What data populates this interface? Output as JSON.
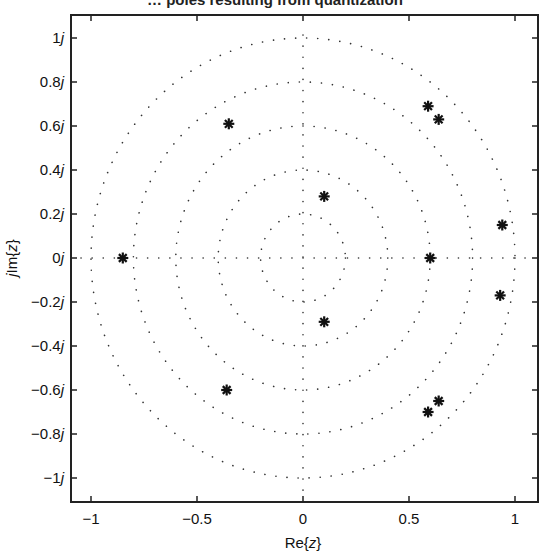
{
  "chart_data": {
    "type": "scatter",
    "title": "… poles resulting from quantization",
    "xlabel": "Re{z}",
    "ylabel": "jIm{z}",
    "xlim": [
      -1.1,
      1.1
    ],
    "ylim": [
      -1.1,
      1.1
    ],
    "x_ticks": [
      -1,
      -0.5,
      0,
      0.5,
      1
    ],
    "x_tick_labels": [
      "−1",
      "−0.5",
      "0",
      "0.5",
      "1"
    ],
    "y_ticks": [
      1,
      0.8,
      0.6,
      0.4,
      0.2,
      0,
      -0.2,
      -0.4,
      -0.6,
      -0.8,
      -1
    ],
    "y_tick_labels": [
      "1j",
      "0.8j",
      "0.6j",
      "0.4j",
      "0.2j",
      "0j",
      "−0.2j",
      "−0.4j",
      "−0.6j",
      "−0.8j",
      "−1j"
    ],
    "grid": "polar dotted (circles r=0.2,0.4,0.6,0.8,1.0 and real/imag axes)",
    "grid_circle_radii": [
      0.2,
      0.4,
      0.6,
      0.8,
      1.0
    ],
    "marker": "asterisk",
    "series": [
      {
        "name": "poles",
        "points": [
          {
            "x": -0.85,
            "y": 0.0
          },
          {
            "x": -0.35,
            "y": 0.61
          },
          {
            "x": -0.36,
            "y": -0.6
          },
          {
            "x": 0.1,
            "y": 0.28
          },
          {
            "x": 0.1,
            "y": -0.29
          },
          {
            "x": 0.59,
            "y": 0.69
          },
          {
            "x": 0.64,
            "y": 0.63
          },
          {
            "x": 0.6,
            "y": 0.0
          },
          {
            "x": 0.94,
            "y": 0.15
          },
          {
            "x": 0.93,
            "y": -0.17
          },
          {
            "x": 0.64,
            "y": -0.65
          },
          {
            "x": 0.59,
            "y": -0.7
          }
        ]
      }
    ]
  }
}
